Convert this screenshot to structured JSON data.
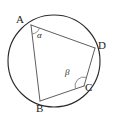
{
  "figure": {
    "name": "cyclic-quadrilateral",
    "background_color": "#ffffff",
    "stroke_color": "#2b2b2b",
    "chord_color": "#555555",
    "arc_color": "#777777",
    "width": 117,
    "height": 125
  },
  "circle": {
    "center_x": 54,
    "center_y": 61,
    "radius": 46
  },
  "vertices": [
    {
      "id": "A",
      "label": "A",
      "x": 31,
      "y": 25,
      "label_x": 16,
      "label_y": 14
    },
    {
      "id": "B",
      "label": "B",
      "x": 40,
      "y": 101,
      "label_x": 36,
      "label_y": 103
    },
    {
      "id": "C",
      "label": "C",
      "x": 84,
      "y": 86,
      "label_x": 85,
      "label_y": 82
    },
    {
      "id": "D",
      "label": "D",
      "x": 95,
      "y": 48,
      "label_x": 98,
      "label_y": 40
    }
  ],
  "edges": [
    {
      "from": "A",
      "to": "B"
    },
    {
      "from": "B",
      "to": "C"
    },
    {
      "from": "C",
      "to": "D"
    },
    {
      "from": "D",
      "to": "A"
    }
  ],
  "angles": [
    {
      "id": "alpha",
      "symbol": "α",
      "at_vertex": "A",
      "label_x": 37,
      "label_y": 31,
      "arc_radius": 9
    },
    {
      "id": "beta",
      "symbol": "β",
      "at_vertex": "C",
      "label_x": 65,
      "label_y": 68,
      "arc_radius": 9
    }
  ]
}
